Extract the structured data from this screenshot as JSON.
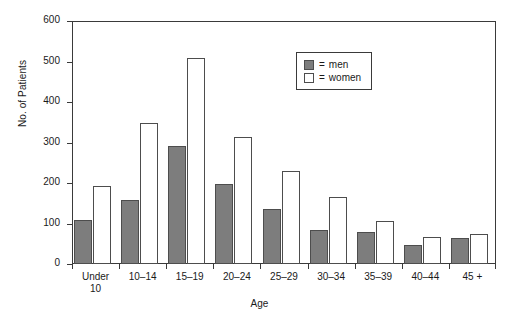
{
  "chart_data": {
    "type": "bar",
    "title": "",
    "xlabel": "Age",
    "ylabel": "No. of Patients",
    "categories": [
      "Under\n10",
      "10–14",
      "15–19",
      "20–24",
      "25–29",
      "30–34",
      "35–39",
      "40–44",
      "45 +"
    ],
    "series": [
      {
        "name": "men",
        "values": [
          108,
          157,
          292,
          197,
          137,
          83,
          78,
          48,
          64
        ],
        "color": "#7d7d7d"
      },
      {
        "name": "women",
        "values": [
          193,
          348,
          508,
          314,
          230,
          166,
          105,
          67,
          74
        ],
        "color": "#ffffff"
      }
    ],
    "ylim": [
      0,
      600
    ],
    "yticks": [
      0,
      100,
      200,
      300,
      400,
      500,
      600
    ],
    "ytick_labels": [
      "0",
      "100",
      "200",
      "300",
      "400",
      "500",
      "600"
    ],
    "grid": false,
    "legend_position": "top-right",
    "legend_entries": [
      {
        "prefix": "=",
        "label": "men"
      },
      {
        "prefix": "=",
        "label": "women"
      }
    ]
  }
}
